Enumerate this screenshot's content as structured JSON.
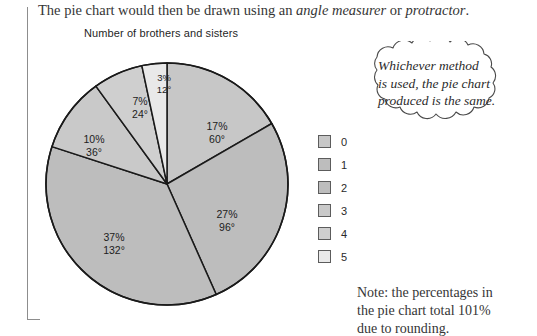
{
  "intro": {
    "part1": "The pie chart would then be drawn using an ",
    "em1": "angle measurer",
    "part2": " or ",
    "em2": "protractor",
    "part3": "."
  },
  "chart_data": {
    "type": "pie",
    "title": "Number of brothers and sisters",
    "xlabel": "",
    "ylabel": "",
    "legend_position": "right",
    "start_angle_deg": 0,
    "direction": "clockwise",
    "categories": [
      "0",
      "1",
      "2",
      "3",
      "4",
      "5"
    ],
    "values": [
      17,
      27,
      37,
      10,
      7,
      3
    ],
    "angles_deg": [
      60,
      96,
      132,
      36,
      24,
      12
    ],
    "slice_colors": [
      "#c7c7c7",
      "#bdbdbd",
      "#bdbdbd",
      "#c9c9c9",
      "#cfcfcf",
      "#e9e9e9"
    ],
    "slice_labels": [
      {
        "percent": "17%",
        "angle": "60°"
      },
      {
        "percent": "27%",
        "angle": "96°"
      },
      {
        "percent": "37%",
        "angle": "132°"
      },
      {
        "percent": "10%",
        "angle": "36°"
      },
      {
        "percent": "7%",
        "angle": "24°"
      },
      {
        "percent": "3%",
        "angle": "12°"
      }
    ],
    "legend_entries": [
      {
        "label": "0",
        "color": "#c7c7c7"
      },
      {
        "label": "1",
        "color": "#bdbdbd"
      },
      {
        "label": "2",
        "color": "#bdbdbd"
      },
      {
        "label": "3",
        "color": "#c9c9c9"
      },
      {
        "label": "4",
        "color": "#cfcfcf"
      },
      {
        "label": "5",
        "color": "#e9e9e9"
      }
    ],
    "note": "Note: the percentages in the pie chart total 101% due to rounding."
  },
  "callout": {
    "line1": "Whichever method",
    "line2": "is used, the pie chart",
    "line3": "produced is the same."
  },
  "note": {
    "line1": "Note: the percentages in",
    "line2": "the pie chart total 101%",
    "line3": "due to rounding."
  },
  "colors": {
    "rule": "#8d8d8d",
    "outline": "#1a1a1a",
    "text": "#2b2b2b"
  }
}
